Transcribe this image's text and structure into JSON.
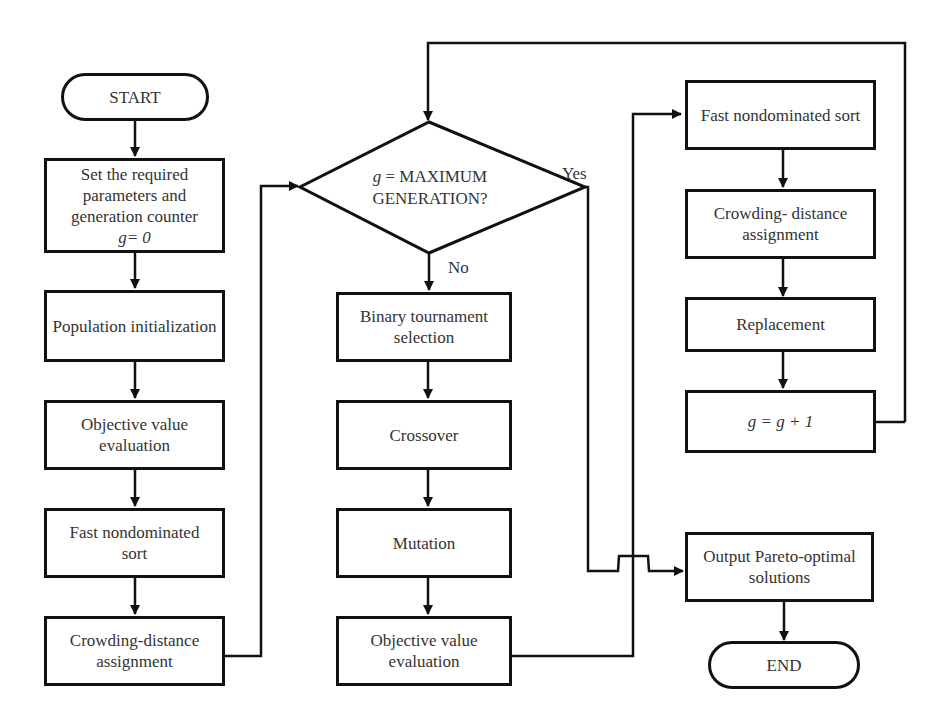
{
  "diagram": {
    "type": "flowchart",
    "nodes": {
      "start": "START",
      "set_params_l1": "Set the required",
      "set_params_l2": "parameters and",
      "set_params_l3": "generation counter",
      "set_params_l4": "g= 0",
      "pop_init": "Population initialization",
      "obj_eval_1_l1": "Objective value",
      "obj_eval_1_l2": "evaluation",
      "fns_1_l1": "Fast nondominated",
      "fns_1_l2": "sort",
      "crowd_1_l1": "Crowding-distance",
      "crowd_1_l2": "assignment",
      "decision_l1": "g = MAXIMUM",
      "decision_l2": "GENERATION?",
      "bts_l1": "Binary tournament",
      "bts_l2": "selection",
      "crossover": "Crossover",
      "mutation": "Mutation",
      "obj_eval_2_l1": "Objective value",
      "obj_eval_2_l2": "evaluation",
      "fns_2": "Fast nondominated sort",
      "crowd_2_l1": "Crowding- distance",
      "crowd_2_l2": "assignment",
      "replacement": "Replacement",
      "increment": "g = g + 1",
      "output_l1": "Output Pareto-optimal",
      "output_l2": "solutions",
      "end": "END"
    },
    "edge_labels": {
      "yes": "Yes",
      "no": "No"
    },
    "edges": [
      [
        "start",
        "set_params"
      ],
      [
        "set_params",
        "pop_init"
      ],
      [
        "pop_init",
        "obj_eval_1"
      ],
      [
        "obj_eval_1",
        "fns_1"
      ],
      [
        "fns_1",
        "crowd_1"
      ],
      [
        "crowd_1",
        "decision"
      ],
      [
        "decision",
        "bts",
        "No"
      ],
      [
        "decision",
        "output",
        "Yes"
      ],
      [
        "bts",
        "crossover"
      ],
      [
        "crossover",
        "mutation"
      ],
      [
        "mutation",
        "obj_eval_2"
      ],
      [
        "obj_eval_2",
        "fns_2"
      ],
      [
        "fns_2",
        "crowd_2"
      ],
      [
        "crowd_2",
        "replacement"
      ],
      [
        "replacement",
        "increment"
      ],
      [
        "increment",
        "decision"
      ],
      [
        "output",
        "end"
      ]
    ]
  }
}
